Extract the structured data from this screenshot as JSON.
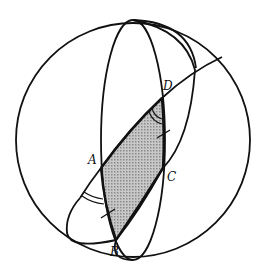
{
  "diagram": {
    "points": {
      "A": {
        "label": "A",
        "x": 101,
        "y": 168
      },
      "B": {
        "label": "B",
        "x": 116,
        "y": 240
      },
      "C": {
        "label": "C",
        "x": 163,
        "y": 168
      },
      "D": {
        "label": "D",
        "x": 162,
        "y": 98
      }
    },
    "colors": {
      "stroke": "#111111",
      "fill": "#b4b4b4",
      "background": "#ffffff"
    }
  }
}
